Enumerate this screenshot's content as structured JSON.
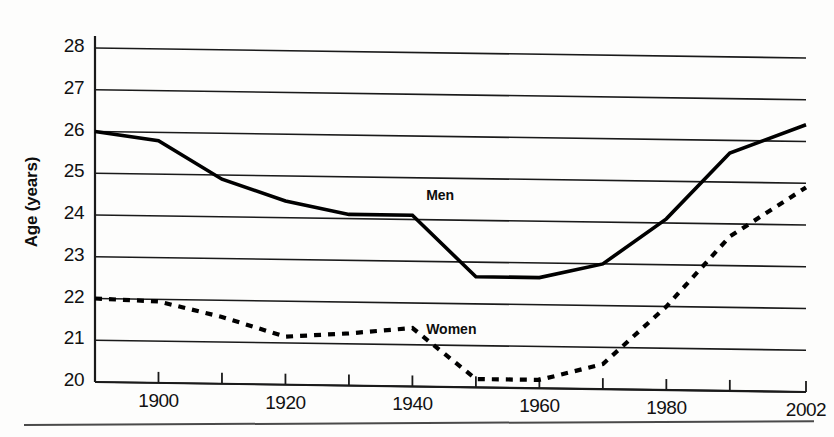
{
  "chart_data": {
    "type": "line",
    "title": "",
    "subtitle": "",
    "xlabel": "",
    "ylabel": "Age (years)",
    "xlim": [
      1890,
      2002
    ],
    "ylim": [
      20,
      28
    ],
    "grid": true,
    "grid_axis": "y",
    "legend_position": "inline-annotations",
    "y_ticks": [
      20,
      21,
      22,
      23,
      24,
      25,
      26,
      27,
      28
    ],
    "y_tick_labels": [
      "20",
      "21",
      "22",
      "23",
      "24",
      "25",
      "26",
      "27",
      "28"
    ],
    "x_ticks": [
      1890,
      1900,
      1910,
      1920,
      1930,
      1940,
      1950,
      1960,
      1970,
      1980,
      1990,
      2002
    ],
    "x_tick_labels": [
      "",
      "1900",
      "",
      "1920",
      "",
      "1940",
      "",
      "1960",
      "",
      "1980",
      "",
      "2002"
    ],
    "x_labeled_ticks": [
      "1900",
      "1920",
      "1940",
      "1960",
      "1980",
      "2002"
    ],
    "x": [
      1890,
      1900,
      1910,
      1920,
      1930,
      1940,
      1950,
      1960,
      1970,
      1980,
      1990,
      2002
    ],
    "series": [
      {
        "name": "Men",
        "style": "solid",
        "color": "#000000",
        "values": [
          26.0,
          25.8,
          24.9,
          24.4,
          24.1,
          24.1,
          22.65,
          22.65,
          23.0,
          24.1,
          25.7,
          26.4
        ]
      },
      {
        "name": "Women",
        "style": "dashed",
        "color": "#000000",
        "values": [
          22.0,
          21.95,
          21.6,
          21.15,
          21.25,
          21.4,
          20.2,
          20.2,
          20.6,
          22.0,
          23.7,
          24.9
        ]
      }
    ],
    "annotations": [
      {
        "text": "Men",
        "x": 1945,
        "y": 24.55
      },
      {
        "text": "Women",
        "x": 1945,
        "y": 21.35
      }
    ]
  },
  "axis": {
    "y_title": "Age (years)"
  },
  "labels": {
    "men": "Men",
    "women": "Women"
  }
}
